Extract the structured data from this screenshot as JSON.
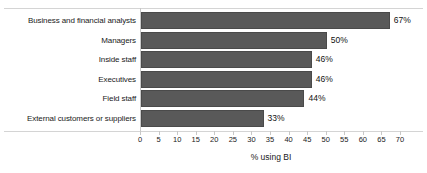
{
  "chart_data": {
    "type": "bar",
    "orientation": "horizontal",
    "title": "",
    "xlabel": "% using BI",
    "ylabel": "",
    "categories": [
      "Business and financial analysts",
      "Managers",
      "Inside staff",
      "Executives",
      "Field staff",
      "External customers or suppliers"
    ],
    "values": [
      67,
      50,
      46,
      46,
      44,
      33
    ],
    "data_labels": [
      "67%",
      "50%",
      "46%",
      "46%",
      "44%",
      "33%"
    ],
    "xlim": [
      0,
      70
    ],
    "xticks": [
      0,
      5,
      10,
      15,
      20,
      25,
      30,
      35,
      40,
      45,
      50,
      55,
      60,
      65,
      70
    ],
    "xtick_labels": [
      "0",
      "5",
      "10",
      "15",
      "20",
      "25",
      "30",
      "35",
      "40",
      "45",
      "50",
      "55",
      "60",
      "65",
      "70"
    ],
    "grid": false,
    "legend": null,
    "bar_color": "#595959",
    "bar_border_color": "#4a4a4a",
    "axis_line_color": "#c8c8c8",
    "rule_color": "#d4d4d4",
    "text_color": "#1a1a1a",
    "background": "#ffffff"
  }
}
